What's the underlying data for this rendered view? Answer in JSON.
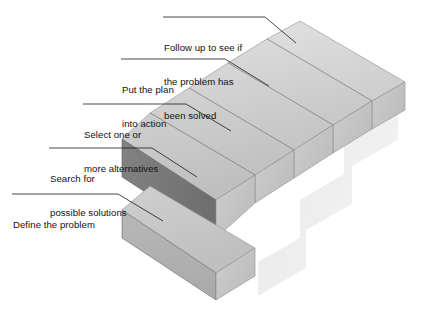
{
  "diagram": {
    "type": "isometric-staircase-process",
    "background_color": "#ffffff",
    "step_count": 5,
    "palette": {
      "tread_light": "#d9d9d9",
      "tread_mid": "#cfcfcf",
      "riser_dark": "#8e8e8e",
      "riser_darkest": "#7b7b7b",
      "side_light": "#c6c6c6",
      "side_face": "#b0b0b0",
      "outline": "#6f6f6f",
      "shadow": "#ececec",
      "leader_line": "#1a1a1a",
      "text": "#111111"
    },
    "steps": [
      {
        "index": 1,
        "order": "bottom",
        "label": "Define the problem",
        "label_lines": [
          "Define the problem"
        ],
        "tread_color": "#d2d2d2",
        "riser_color": "#909090"
      },
      {
        "index": 2,
        "order": "second",
        "label": "Search for possible solutions",
        "label_lines": [
          "Search for",
          "possible solutions"
        ],
        "tread_color": "#cccccc",
        "riser_color": "#858585"
      },
      {
        "index": 3,
        "order": "third",
        "label": "Select one or more alternatives",
        "label_lines": [
          "Select one or",
          "more alternatives"
        ],
        "tread_color": "#cfcfcf",
        "riser_color": "#8d8d8d"
      },
      {
        "index": 4,
        "order": "fourth",
        "label": "Put the plan into action",
        "label_lines": [
          "Put the plan",
          "into action"
        ],
        "tread_color": "#d6d6d6",
        "riser_color": "#9a9a9a"
      },
      {
        "index": 5,
        "order": "top",
        "label": "Follow up to see if the problem has been solved",
        "label_lines": [
          "Follow up to see if",
          "the problem has",
          "been solved"
        ],
        "tread_color": "#dcdcdc",
        "riser_color": "#a5a5a5"
      }
    ]
  }
}
